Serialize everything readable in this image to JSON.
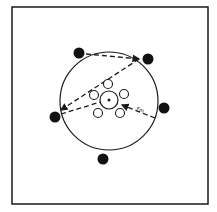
{
  "diagram": {
    "type": "circular-arrangement",
    "frame": {
      "x": 12,
      "y": 7,
      "width": 196,
      "height": 197,
      "stroke": "#1a1a1a"
    },
    "outer_circle": {
      "cx": 109,
      "cy": 101,
      "r": 49,
      "stroke": "#1a1a1a"
    },
    "hub": {
      "cx": 109,
      "cy": 100,
      "r": 9
    },
    "inner_nodes": [
      {
        "cx": 108,
        "cy": 84,
        "r": 4.5
      },
      {
        "cx": 94,
        "cy": 95,
        "r": 4.5
      },
      {
        "cx": 124,
        "cy": 94,
        "r": 4.5
      },
      {
        "cx": 98,
        "cy": 113,
        "r": 4.5
      },
      {
        "cx": 120,
        "cy": 113,
        "r": 4.5
      }
    ],
    "outer_points": [
      {
        "cx": 79,
        "cy": 53,
        "r": 5.5
      },
      {
        "cx": 148,
        "cy": 59,
        "r": 5.5
      },
      {
        "cx": 164,
        "cy": 108,
        "r": 5.5
      },
      {
        "cx": 55,
        "cy": 117,
        "r": 5.5
      },
      {
        "cx": 103,
        "cy": 159,
        "r": 5.5
      }
    ],
    "dashed_lines": [
      {
        "x1": 86,
        "y1": 54,
        "x2": 139,
        "y2": 59
      },
      {
        "x1": 139,
        "y1": 59,
        "x2": 61,
        "y2": 110
      },
      {
        "x1": 61,
        "y1": 114,
        "x2": 107,
        "y2": 100
      },
      {
        "x1": 155,
        "y1": 118,
        "x2": 122,
        "y2": 105
      }
    ],
    "label_fm": "Fm",
    "ink_color": "#1a1a1a"
  }
}
